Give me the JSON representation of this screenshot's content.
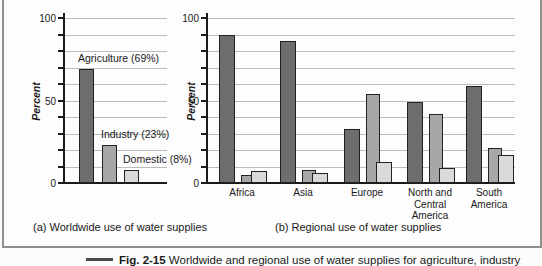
{
  "colors": {
    "page_bg": "#fcfcfc",
    "box_border": "#8f8f8f",
    "axis": "#1a1a1a",
    "gridline": "#bcbcbc",
    "text": "#1a1a1a",
    "bar_border": "#222222",
    "palette": [
      "#6d6d6d",
      "#a7a7a7",
      "#dadada"
    ],
    "caption_dash": "#4a4a4a"
  },
  "chart_data": [
    {
      "type": "bar",
      "title": "(a) Worldwide use of water supplies",
      "ylabel": "Percent",
      "ylim": [
        0,
        100
      ],
      "yticks": [
        0,
        50,
        100
      ],
      "grid_step": 10,
      "grid": true,
      "legend_position": "none",
      "categories": [
        "Agriculture",
        "Industry",
        "Domestic"
      ],
      "values": [
        69,
        23,
        8
      ],
      "bar_labels": [
        "Agriculture (69%)",
        "Industry (23%)",
        "Domestic (8%)"
      ]
    },
    {
      "type": "bar",
      "title": "(b) Regional use of water supplies",
      "ylabel": "Percent",
      "ylim": [
        0,
        100
      ],
      "yticks": [
        0,
        50,
        100
      ],
      "grid_step": 10,
      "grid": true,
      "legend_position": "none",
      "categories": [
        "Africa",
        "Asia",
        "Europe",
        "North and\nCentral\nAmerica",
        "South\nAmerica"
      ],
      "series": [
        {
          "name": "Agriculture",
          "values": [
            90,
            86,
            33,
            49,
            59
          ]
        },
        {
          "name": "Industry",
          "values": [
            5,
            8,
            54,
            42,
            21
          ]
        },
        {
          "name": "Domestic",
          "values": [
            7,
            6,
            13,
            9,
            17
          ]
        }
      ]
    }
  ],
  "figure_caption": {
    "label": "Fig. 2-15",
    "text": " Worldwide and regional use of water supplies for agriculture, industry"
  }
}
